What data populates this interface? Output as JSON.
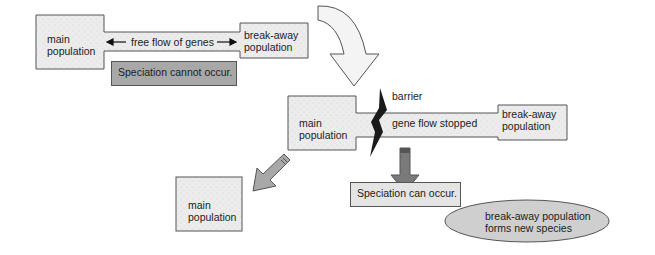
{
  "stage1": {
    "main_population": "main\npopulation",
    "flow_label": "free flow of genes",
    "breakaway_population": "break-away\npopulation",
    "note": "Speciation cannot occur."
  },
  "stage2": {
    "main_population": "main\npopulation",
    "barrier_label": "barrier",
    "flow_label": "gene flow stopped",
    "breakaway_population": "break-away\npopulation",
    "note": "Speciation can occur."
  },
  "outcome": {
    "main_population": "main\npopulation",
    "new_species": "break-away population\nforms new species"
  },
  "colors": {
    "box_fill": "#ebebeb",
    "note_dark_fill": "#a8a8a8",
    "note_light_fill": "#e4e4e4",
    "arrow_dark": "#6e6e6e",
    "arrow_light": "#f4f4f4",
    "barrier": "#1a1a1a",
    "border": "#555555"
  }
}
